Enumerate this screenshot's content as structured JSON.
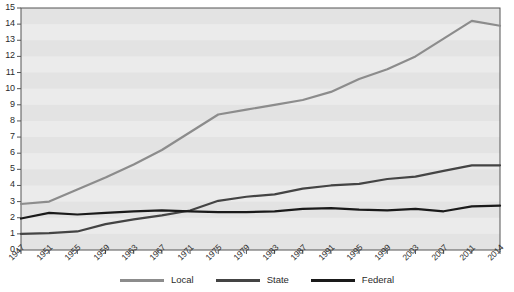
{
  "chart_data": {
    "type": "line",
    "title": "",
    "subtitle": "",
    "xlabel": "",
    "ylabel": "",
    "xlim": [
      1947,
      2014
    ],
    "ylim": [
      0,
      15
    ],
    "ytick_step": 1,
    "grid": true,
    "grid_style": "horizontal-banded",
    "legend_position": "bottom-center",
    "x": [
      1947,
      1951,
      1955,
      1959,
      1963,
      1967,
      1971,
      1975,
      1979,
      1983,
      1987,
      1991,
      1995,
      1999,
      2003,
      2007,
      2011,
      2014
    ],
    "categories": [
      "1947",
      "1951",
      "1955",
      "1959",
      "1963",
      "1967",
      "1971",
      "1975",
      "1979",
      "1983",
      "1987",
      "1991",
      "1995",
      "1999",
      "2003",
      "2007",
      "2011",
      "2014"
    ],
    "ytick_labels": [
      "0",
      "1",
      "2",
      "3",
      "4",
      "5",
      "6",
      "7",
      "8",
      "9",
      "10",
      "11",
      "12",
      "13",
      "14",
      "15"
    ],
    "series": [
      {
        "name": "Local",
        "color": "#8c8c8c",
        "values": [
          2.85,
          3.0,
          3.75,
          4.5,
          5.3,
          6.2,
          7.3,
          8.4,
          8.7,
          9.0,
          9.3,
          9.8,
          10.6,
          11.2,
          12.0,
          13.1,
          14.2,
          13.9
        ]
      },
      {
        "name": "State",
        "color": "#444444",
        "values": [
          1.0,
          1.05,
          1.15,
          1.6,
          1.9,
          2.15,
          2.45,
          3.05,
          3.3,
          3.45,
          3.8,
          4.0,
          4.1,
          4.4,
          4.55,
          4.9,
          5.25,
          5.25
        ]
      },
      {
        "name": "Federal",
        "color": "#1a1a1a",
        "values": [
          1.95,
          2.3,
          2.2,
          2.3,
          2.4,
          2.45,
          2.4,
          2.35,
          2.35,
          2.4,
          2.55,
          2.6,
          2.5,
          2.45,
          2.55,
          2.4,
          2.7,
          2.75
        ]
      }
    ]
  },
  "legend": {
    "entries": [
      {
        "label": "Local",
        "color": "#8c8c8c"
      },
      {
        "label": "State",
        "color": "#444444"
      },
      {
        "label": "Federal",
        "color": "#1a1a1a"
      }
    ]
  },
  "axes": {
    "plot_bg": "#ebebeb",
    "band_color": "#e3e3e3",
    "frame_color": "#555555"
  }
}
